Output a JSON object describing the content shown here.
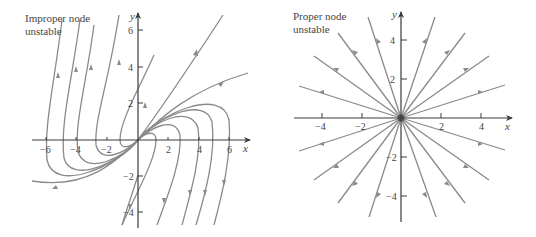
{
  "left_plot": {
    "title_line1": "Improper node",
    "title_line2": "unstable",
    "x_axis_label": "x",
    "y_axis_label": "y",
    "x_ticks": [
      "−6",
      "−4",
      "−2",
      "2",
      "4",
      "6"
    ],
    "y_ticks": [
      "6",
      "4",
      "2",
      "−2",
      "−4"
    ]
  },
  "right_plot": {
    "title_line1": "Proper node",
    "title_line2": "unstable",
    "x_axis_label": "x",
    "y_axis_label": "y",
    "x_ticks": [
      "−4",
      "−2",
      "2",
      "4"
    ],
    "y_ticks": [
      "4",
      "2",
      "−2",
      "−4"
    ]
  },
  "colors": {
    "trajectory": "#8a8a8a",
    "axis": "#3a3a3a",
    "text": "#444444"
  }
}
